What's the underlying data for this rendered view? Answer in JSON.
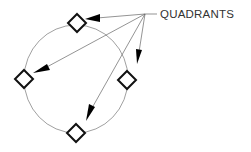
{
  "diagram": {
    "label": "QUADRANTS",
    "markers": [
      {
        "name": "top-quadrant",
        "position": "top"
      },
      {
        "name": "left-quadrant",
        "position": "left"
      },
      {
        "name": "right-quadrant",
        "position": "right"
      },
      {
        "name": "bottom-quadrant",
        "position": "bottom"
      }
    ],
    "colors": {
      "circle": "#888888",
      "marker": "#111111",
      "leader": "#666666",
      "arrowhead": "#000000",
      "text": "#333333"
    }
  }
}
